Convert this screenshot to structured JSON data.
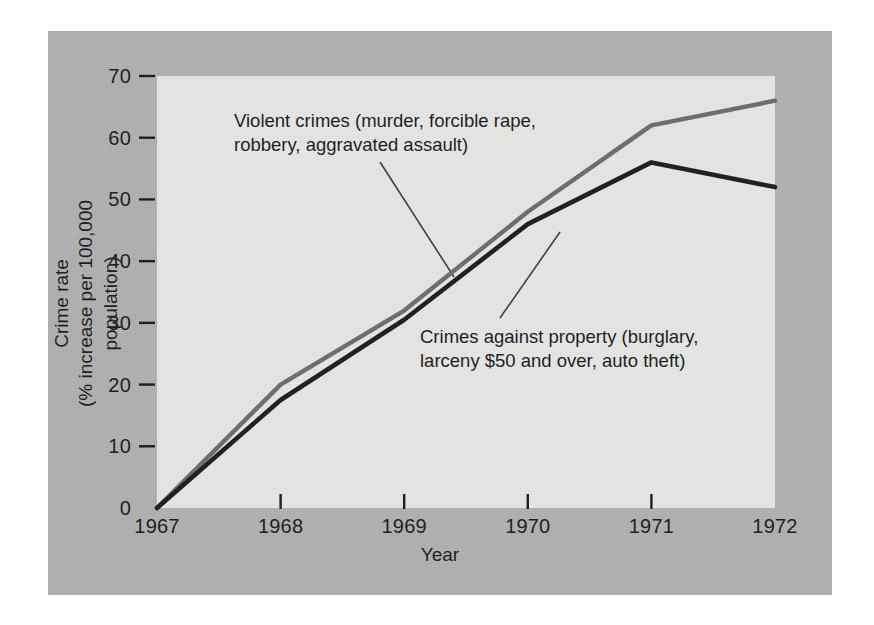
{
  "chart_data": {
    "type": "line",
    "title": "",
    "xlabel": "Year",
    "ylabel": "Crime rate (% increase per 100,000 population)",
    "ylabel_lines": [
      "Crime rate",
      "(% increase per 100,000 population)"
    ],
    "x": [
      1967,
      1968,
      1969,
      1970,
      1971,
      1972
    ],
    "categories": [
      "1967",
      "1968",
      "1969",
      "1970",
      "1971",
      "1972"
    ],
    "xticklabels": [
      "1967",
      "1968",
      "1969",
      "1970",
      "1971",
      "1972"
    ],
    "yticks": [
      0,
      10,
      20,
      30,
      40,
      50,
      60,
      70
    ],
    "yticklabels": [
      "0",
      "10",
      "20",
      "30",
      "40",
      "50",
      "60",
      "70"
    ],
    "ylim": [
      0,
      70
    ],
    "xlim": [
      1967,
      1972
    ],
    "grid": false,
    "legend": "none (inline annotations with leader lines)",
    "series": [
      {
        "name": "Violent crimes (murder, forcible rape, robbery, aggravated assault)",
        "color": "#6b6b6b",
        "values": [
          0,
          20,
          32,
          48,
          62,
          66
        ]
      },
      {
        "name": "Crimes against property (burglary, larceny $50 and over, auto theft)",
        "color": "#1a1a1a",
        "values": [
          0,
          17.5,
          30.5,
          46,
          56,
          52
        ]
      }
    ],
    "annotations": [
      {
        "id": "violent",
        "lines": [
          "Violent crimes (murder, forcible rape,",
          "robbery, aggravated assault)"
        ]
      },
      {
        "id": "property",
        "lines": [
          "Crimes against property (burglary,",
          "larceny $50 and over, auto theft)"
        ]
      }
    ]
  },
  "colors": {
    "figure_background": "#b0b0b0",
    "plot_background": "#e2e2e0",
    "violent_line": "#6b6b6b",
    "property_line": "#1a1a1a",
    "text": "#17181a"
  }
}
